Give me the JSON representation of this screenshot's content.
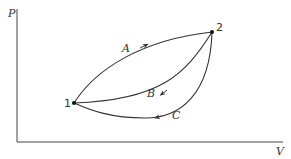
{
  "diagram": {
    "type": "PV diagram",
    "axes": {
      "y_label": "P",
      "x_label": "V"
    },
    "states": [
      {
        "id": "1",
        "label": "1"
      },
      {
        "id": "2",
        "label": "2"
      }
    ],
    "paths": [
      {
        "id": "A",
        "label": "A",
        "from": "1",
        "to": "2"
      },
      {
        "id": "B",
        "label": "B",
        "from": "2",
        "to": "1"
      },
      {
        "id": "C",
        "label": "C",
        "from": "2",
        "to": "1"
      }
    ],
    "colors": {
      "line": "#333333",
      "background": "#ffffff"
    }
  }
}
